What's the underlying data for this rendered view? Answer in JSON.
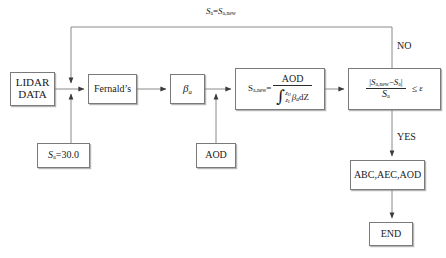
{
  "diagram": {
    "accent_line_color": "#8a8a8a",
    "box_border_color": "#7a7a7a",
    "text_color": "#1a1a1a"
  },
  "nodes": {
    "lidar_data": {
      "line1": "LIDAR",
      "line2": "DATA"
    },
    "fernalds": {
      "label": "Fernald’s"
    },
    "beta_a": {
      "symbol": "β",
      "sub": "a"
    },
    "sa_init": {
      "symbol": "S",
      "sub": "a",
      "value": "=30.0"
    },
    "aod_input": {
      "label": "AOD"
    },
    "formula": {
      "lhs_symbol": "S",
      "lhs_sub": "a,new",
      "equals": "=",
      "numerator": "AOD",
      "integral_glyph": "∫",
      "limit_upper_symbol": "z",
      "limit_upper_sub": "H",
      "limit_lower_symbol": "z",
      "limit_lower_sub": "L",
      "denominator_integrand_symbol": "β",
      "denominator_integrand_sub": "a",
      "denominator_differential": "dZ"
    },
    "condition": {
      "bar_open": "|",
      "num_first_symbol": "S",
      "num_first_sub": "a,new",
      "minus": "−",
      "num_second_symbol": "S",
      "num_second_sub": "a",
      "bar_close": "|",
      "den_symbol": "S",
      "den_sub": "a",
      "operator": "≤",
      "epsilon": "ε"
    },
    "outputs": {
      "label": "ABC,AEC,AOD"
    },
    "end": {
      "label": "END"
    }
  },
  "edge_labels": {
    "feedback": {
      "lhs_symbol": "S",
      "lhs_sub": "a",
      "equals": "=",
      "rhs_symbol": "S",
      "rhs_sub": "a,new"
    },
    "no": {
      "label": "NO"
    },
    "yes": {
      "label": "YES"
    }
  }
}
